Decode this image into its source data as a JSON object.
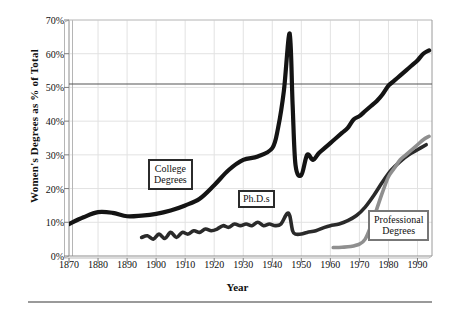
{
  "chart_data": {
    "type": "line",
    "title": "",
    "xlabel": "Year",
    "ylabel": "Women's Degrees as % of Total",
    "xlim": [
      1870,
      1995
    ],
    "ylim": [
      0,
      70
    ],
    "grid": true,
    "legend_position": "inline-callouts",
    "xticks": [
      "1870",
      "1880",
      "1890",
      "1900",
      "1910",
      "1920",
      "1930",
      "1940",
      "1950",
      "1960",
      "1970",
      "1980",
      "1990"
    ],
    "yticks": [
      "0%",
      "10%",
      "20%",
      "30%",
      "40%",
      "50%",
      "60%",
      "70%"
    ],
    "reference_line": {
      "label": "50%",
      "value": 51,
      "color": "#555555"
    },
    "series": [
      {
        "name": "College Degrees",
        "color": "#141414",
        "callout": "College\nDegrees",
        "callout_line1": "College",
        "callout_line2": "Degrees",
        "x": [
          1870,
          1875,
          1880,
          1885,
          1890,
          1895,
          1900,
          1905,
          1910,
          1915,
          1920,
          1925,
          1930,
          1935,
          1940,
          1942,
          1944,
          1946,
          1947,
          1948,
          1950,
          1952,
          1954,
          1956,
          1958,
          1960,
          1962,
          1964,
          1966,
          1968,
          1970,
          1972,
          1974,
          1976,
          1978,
          1980,
          1982,
          1984,
          1986,
          1988,
          1990,
          1992,
          1994
        ],
        "y": [
          9.5,
          11.5,
          13.0,
          12.8,
          11.8,
          12.0,
          12.5,
          13.5,
          15.0,
          17.0,
          21.0,
          25.5,
          28.5,
          29.5,
          32.0,
          38.0,
          49.0,
          66.0,
          45.0,
          27.0,
          24.0,
          30.0,
          28.5,
          30.5,
          32.0,
          33.5,
          35.0,
          36.5,
          38.0,
          40.5,
          41.5,
          43.0,
          44.5,
          46.0,
          48.0,
          50.5,
          52.0,
          53.5,
          55.0,
          56.5,
          58.0,
          60.0,
          61.0
        ]
      },
      {
        "name": "Ph.D.s",
        "color": "#2a2a2a",
        "callout": "Ph.D.s",
        "callout_line1": "Ph.D.s",
        "callout_line2": "",
        "x": [
          1895,
          1897,
          1899,
          1901,
          1903,
          1905,
          1907,
          1909,
          1911,
          1913,
          1915,
          1917,
          1919,
          1921,
          1923,
          1925,
          1927,
          1929,
          1931,
          1933,
          1935,
          1937,
          1939,
          1941,
          1943,
          1945,
          1946,
          1947,
          1948,
          1950,
          1952,
          1955,
          1958,
          1960,
          1963,
          1966,
          1969,
          1972,
          1975,
          1978,
          1981,
          1984,
          1987,
          1990,
          1993
        ],
        "y": [
          5.5,
          6.0,
          5.0,
          6.5,
          5.2,
          7.0,
          5.5,
          7.0,
          6.5,
          7.5,
          7.0,
          8.0,
          7.5,
          8.0,
          9.0,
          8.5,
          9.5,
          9.0,
          9.5,
          9.0,
          10.0,
          9.0,
          9.5,
          9.0,
          9.5,
          12.5,
          12.0,
          7.5,
          6.5,
          6.5,
          7.0,
          7.5,
          8.5,
          9.0,
          9.5,
          10.5,
          12.0,
          14.5,
          18.0,
          22.0,
          25.5,
          28.0,
          30.0,
          31.5,
          33.0
        ]
      },
      {
        "name": "Professional Degrees",
        "color": "#8f8f8f",
        "callout": "Professional\nDegrees",
        "callout_line1": "Professional",
        "callout_line2": "Degrees",
        "x": [
          1961,
          1964,
          1967,
          1970,
          1972,
          1974,
          1976,
          1978,
          1980,
          1982,
          1984,
          1986,
          1988,
          1990,
          1992,
          1994
        ],
        "y": [
          2.5,
          2.6,
          2.8,
          3.5,
          5.0,
          9.0,
          14.0,
          19.0,
          23.5,
          26.0,
          28.5,
          30.0,
          31.5,
          33.0,
          34.5,
          35.5
        ]
      }
    ]
  }
}
